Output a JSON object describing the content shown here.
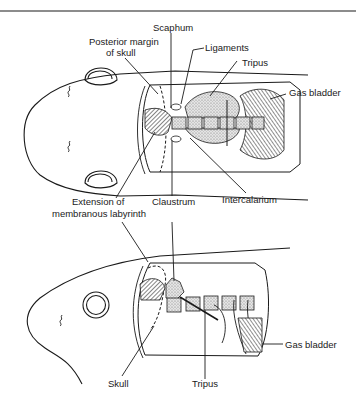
{
  "figure": {
    "type": "anatomical-diagram",
    "colors": {
      "ink": "#1a1a1a",
      "paper": "#ffffff",
      "stipple": "#cfcfcf",
      "hatch": "#555555"
    }
  },
  "top_view": {
    "labels": {
      "scaphum": "Scaphum",
      "posterior_margin_line1": "Posterior margin",
      "posterior_margin_line2": "of skull",
      "ligaments": "Ligaments",
      "tripus": "Tripus",
      "gas_bladder": "Gas bladder",
      "extension_line1": "Extension of",
      "extension_line2": "membranous labyrinth",
      "claustrum": "Claustrum",
      "intercalarium": "Intercalarium"
    }
  },
  "side_view": {
    "labels": {
      "skull": "Skull",
      "tripus": "Tripus",
      "gas_bladder": "Gas bladder"
    }
  }
}
